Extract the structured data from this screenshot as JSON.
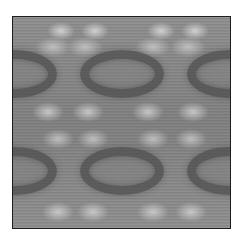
{
  "image": {
    "description": "Grayscale mirrored kaleidoscopic texture inside a thin black square frame",
    "frame_color": "#1e1e1e",
    "background_color": "#ffffff",
    "base_gray": "#888888",
    "dark_ring_color": "#3c3c3c",
    "light_blotch_color": "#d2d2d2",
    "rings": [
      {
        "name": "center-top",
        "cx": 109,
        "cy": 57,
        "rx": 42,
        "ry": 24
      },
      {
        "name": "center-bottom",
        "cx": 109,
        "cy": 154,
        "rx": 42,
        "ry": 24
      },
      {
        "name": "left-top-half",
        "cx": 2,
        "cy": 57,
        "rx": 42,
        "ry": 24
      },
      {
        "name": "left-bottom-half",
        "cx": 2,
        "cy": 154,
        "rx": 42,
        "ry": 24
      },
      {
        "name": "right-top-half",
        "cx": 216,
        "cy": 57,
        "rx": 42,
        "ry": 24
      },
      {
        "name": "right-bottom-half",
        "cx": 216,
        "cy": 154,
        "rx": 42,
        "ry": 24
      }
    ]
  }
}
